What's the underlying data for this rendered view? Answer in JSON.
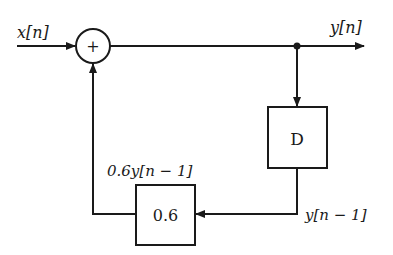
{
  "diagram": {
    "type": "block-diagram",
    "nodes": {
      "adder": {
        "symbol": "+"
      },
      "delay": {
        "label": "D"
      },
      "gain": {
        "label": "0.6"
      }
    },
    "signals": {
      "input": "x[n]",
      "output": "y[n]",
      "delayed": "y[n − 1]",
      "scaled": "0.6y[n − 1]"
    },
    "edges": [
      {
        "from": "input",
        "to": "adder"
      },
      {
        "from": "adder",
        "to": "output"
      },
      {
        "from": "output-junction",
        "to": "delay"
      },
      {
        "from": "delay",
        "to": "gain",
        "label": "y[n − 1]"
      },
      {
        "from": "gain",
        "to": "adder",
        "label": "0.6y[n − 1]"
      }
    ],
    "colors": {
      "stroke": "#1a1a1a",
      "background": "#ffffff"
    }
  }
}
